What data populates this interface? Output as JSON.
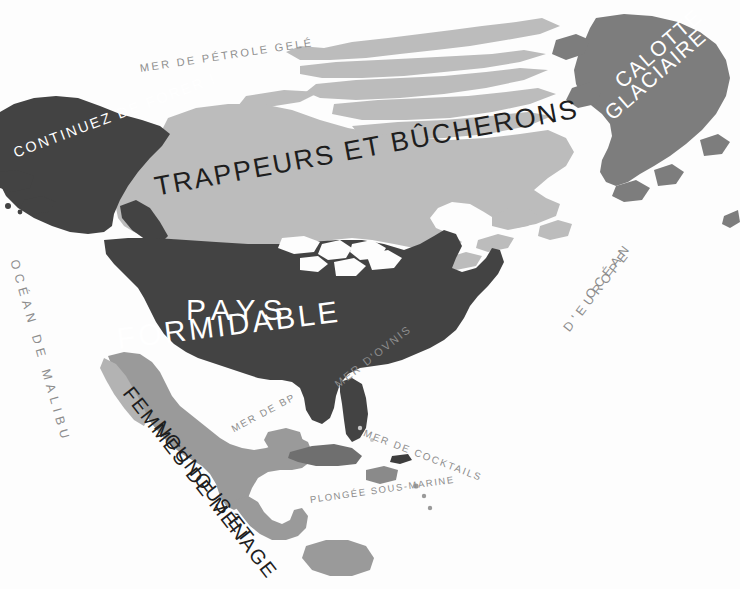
{
  "map": {
    "title": "Carte satirique de l'Amérique du Nord",
    "background_color": "#fdfdfd",
    "palette": {
      "dark_land": "#434343",
      "medium_land": "#9a9a9a",
      "light_land": "#bcbcbc",
      "sea_text": "#8d8d8d",
      "dark_text": "#1e1e1e",
      "light_text": "#ffffff"
    },
    "regions": [
      {
        "id": "alaska",
        "label": "CONTINUEZ DE FORER !",
        "fill": "#434343",
        "text_color": "#ffffff"
      },
      {
        "id": "canada",
        "label": "TRAPPEURS ET BÛCHERONS",
        "fill": "#bcbcbc",
        "text_color": "#1e1e1e"
      },
      {
        "id": "greenland",
        "label_line1": "CALOTTE",
        "label_line2": "GLACIAIRE",
        "fill": "#7d7d7d",
        "text_color": "#ffffff"
      },
      {
        "id": "united-states",
        "label_line1": "PAYS",
        "label_line2": "FORMIDABLE",
        "fill": "#434343",
        "text_color": "#ffffff"
      },
      {
        "id": "mexico",
        "label_line1": "NOUNOUS ET",
        "label_line2": "FEMMES DE MÉNAGE",
        "fill": "#9a9a9a",
        "text_color": "#1e1e1e"
      }
    ],
    "sea_labels": [
      {
        "id": "arctic-ocean",
        "text": "MER DE PÉTROLE GELÉ"
      },
      {
        "id": "pacific-ocean",
        "text": "OCÉAN DE MALIBU"
      },
      {
        "id": "atlantic-1",
        "text": "OCÉAN"
      },
      {
        "id": "atlantic-2",
        "text": "D'EUROPE"
      },
      {
        "id": "gulf-of-mexico",
        "text": "MER DE BP"
      },
      {
        "id": "sargasso",
        "text": "MER D'OVNIS"
      },
      {
        "id": "caribbean",
        "text": "MER DE COCKTAILS"
      },
      {
        "id": "south-caribbean",
        "text": "PLONGÉE SOUS-MARINE"
      }
    ]
  }
}
